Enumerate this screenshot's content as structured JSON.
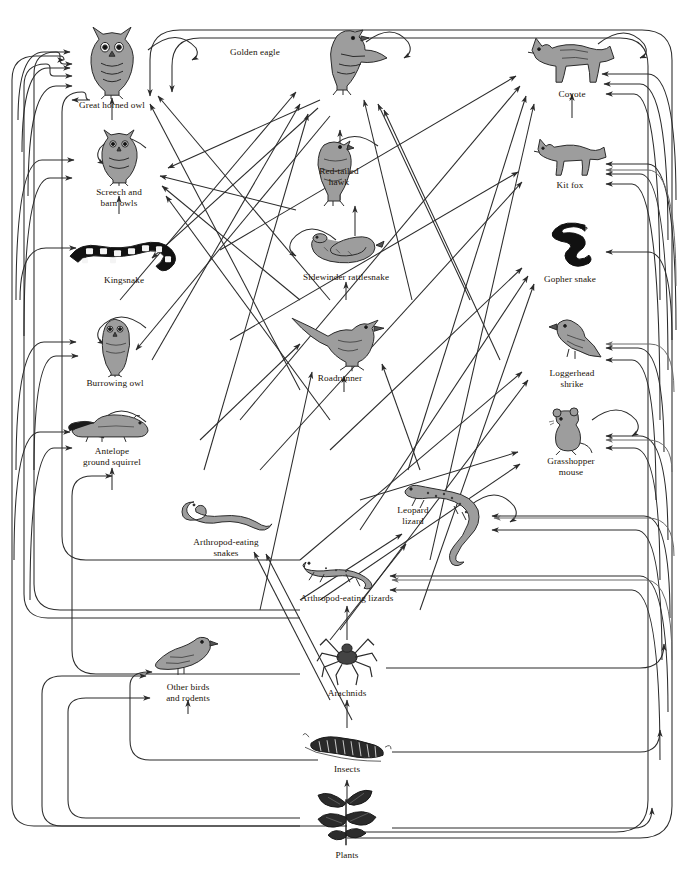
{
  "diagram": {
    "type": "food-web-diagram",
    "node_count": 18,
    "line_color": "#2b2b2b",
    "fill_color": "#9a9a9a",
    "background": "#ffffff"
  },
  "nodes": [
    {
      "id": "great-horned-owl",
      "label": "Great horned owl",
      "x": 112,
      "y": 68,
      "icon": "owl-icon",
      "trophic": "top predator"
    },
    {
      "id": "golden-eagle",
      "label": "Golden eagle",
      "x": 340,
      "y": 62,
      "icon": "eagle-icon",
      "trophic": "top predator"
    },
    {
      "id": "coyote",
      "label": "Coyote",
      "x": 572,
      "y": 68,
      "icon": "coyote-icon",
      "trophic": "top predator"
    },
    {
      "id": "screech-and-barn-owls",
      "label": "Screech and\nbarn owls",
      "x": 119,
      "y": 166,
      "icon": "owl-icon",
      "trophic": "predator"
    },
    {
      "id": "red-tailed-hawk",
      "label": "Red-tailed\nhawk",
      "x": 355,
      "y": 170,
      "icon": "hawk-icon",
      "trophic": "predator"
    },
    {
      "id": "kit-fox",
      "label": "Kit fox",
      "x": 570,
      "y": 167,
      "icon": "fox-icon",
      "trophic": "predator"
    },
    {
      "id": "kingsnake",
      "label": "Kingsnake",
      "x": 124,
      "y": 262,
      "icon": "kingsnake-icon",
      "trophic": "predator"
    },
    {
      "id": "sidewinder-rattlesnake",
      "label": "Sidewinder rattlesnake",
      "x": 346,
      "y": 258,
      "icon": "rattlesnake-icon",
      "trophic": "predator"
    },
    {
      "id": "gopher-snake",
      "label": "Gopher snake",
      "x": 572,
      "y": 255,
      "icon": "gophersnake-icon",
      "trophic": "predator"
    },
    {
      "id": "burrowing-owl",
      "label": "Burrowing owl",
      "x": 115,
      "y": 350,
      "icon": "owl-icon",
      "trophic": "predator"
    },
    {
      "id": "roadrunner",
      "label": "Roadrunner",
      "x": 344,
      "y": 348,
      "icon": "roadrunner-icon",
      "trophic": "predator"
    },
    {
      "id": "loggerhead-shrike",
      "label": "Loggerhead\nshrike",
      "x": 572,
      "y": 355,
      "icon": "shrike-icon",
      "trophic": "predator"
    },
    {
      "id": "antelope-ground-squirrel",
      "label": "Antelope\nground squirrel",
      "x": 112,
      "y": 440,
      "icon": "squirrel-icon",
      "trophic": "herbivore"
    },
    {
      "id": "grasshopper-mouse",
      "label": "Grasshopper\nmouse",
      "x": 571,
      "y": 443,
      "icon": "mouse-icon",
      "trophic": "omnivore"
    },
    {
      "id": "arthropod-eating-snakes",
      "label": "Arthropod-eating\nsnakes",
      "x": 226,
      "y": 527,
      "icon": "snake-icon",
      "trophic": "insectivore"
    },
    {
      "id": "leopard-lizard",
      "label": "Leopard\nlizard",
      "x": 451,
      "y": 527,
      "icon": "lizard-icon",
      "trophic": "predator"
    },
    {
      "id": "arthropod-eating-lizards",
      "label": "Arthropod-eating lizards",
      "x": 347,
      "y": 580,
      "icon": "lizard-icon",
      "trophic": "insectivore"
    },
    {
      "id": "other-birds-and-rodents",
      "label": "Other birds\nand rodents",
      "x": 188,
      "y": 670,
      "icon": "bird-icon",
      "trophic": "omnivore"
    },
    {
      "id": "arachnids",
      "label": "Arachnids",
      "x": 347,
      "y": 667,
      "icon": "spider-icon",
      "trophic": "predator"
    },
    {
      "id": "insects",
      "label": "Insects",
      "x": 347,
      "y": 755,
      "icon": "caterpillar-icon",
      "trophic": "herbivore"
    },
    {
      "id": "plants",
      "label": "Plants",
      "x": 347,
      "y": 825,
      "icon": "plant-icon",
      "trophic": "producer"
    }
  ],
  "legend": {
    "arrow_meaning": "arrow points from food source to consumer",
    "self_loop_meaning": "cannibalism / intraguild feeding"
  }
}
